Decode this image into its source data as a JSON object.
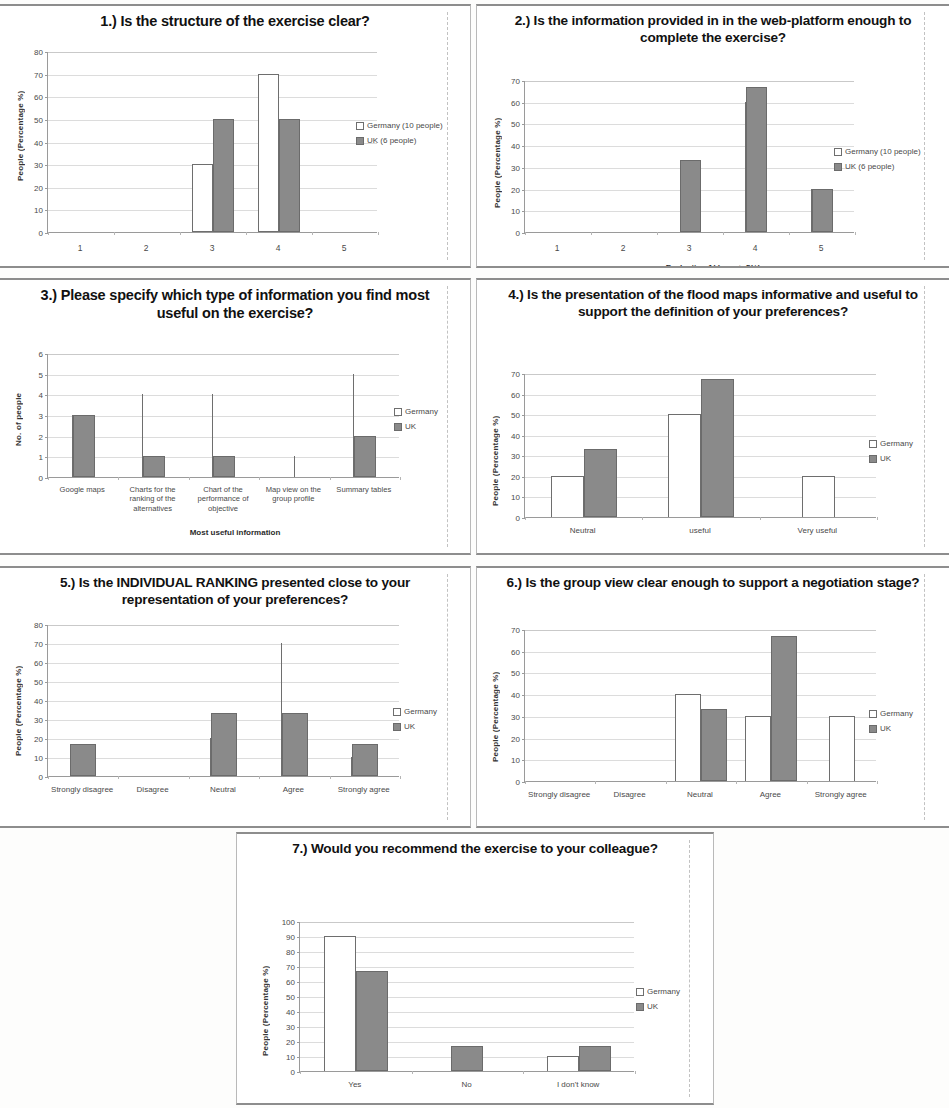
{
  "page": {
    "background": "#fdfdfc",
    "series_colors": {
      "germany": "#ffffff",
      "uk": "#8a8a8a",
      "outline": "#6e6e6e"
    }
  },
  "charts": [
    {
      "id": "q1",
      "title": "1.) Is the structure of the exercise clear?",
      "ylabel": "People (Percentage %)",
      "xlabel": "Evaluation 1(-) ------> 5(+)",
      "categories": [
        "1",
        "2",
        "3",
        "4",
        "5"
      ],
      "yticks": [
        "0",
        "10",
        "20",
        "30",
        "40",
        "50",
        "60",
        "70",
        "80"
      ],
      "legend": [
        "Germany (10 people)",
        "UK (6 people)"
      ],
      "chart_data": {
        "type": "bar",
        "title": "1.) Is the structure of the exercise clear?",
        "xlabel": "Evaluation 1(-) ------> 5(+)",
        "ylabel": "People (Percentage %)",
        "categories": [
          "1",
          "2",
          "3",
          "4",
          "5"
        ],
        "ylim": [
          0,
          80
        ],
        "ytick_step": 10,
        "grid": true,
        "legend_position": "right",
        "series": [
          {
            "name": "Germany (10 people)",
            "values": [
              0,
              0,
              30,
              70,
              0
            ]
          },
          {
            "name": "UK (6 people)",
            "values": [
              0,
              0,
              50,
              50,
              0
            ]
          }
        ]
      }
    },
    {
      "id": "q2",
      "title": "2.) Is the information provided in in the web-platform enough to complete the exercise?",
      "ylabel": "People (Percentage %)",
      "xlabel": "Evaluation 1(-) ------> 5(+)",
      "categories": [
        "1",
        "2",
        "3",
        "4",
        "5"
      ],
      "yticks": [
        "0",
        "10",
        "20",
        "30",
        "40",
        "50",
        "60",
        "70"
      ],
      "legend": [
        "Germany (10 people)",
        "UK (6 people)"
      ],
      "chart_data": {
        "type": "bar",
        "title": "2.) Is the information provided in in the web-platform enough to complete the exercise?",
        "xlabel": "Evaluation 1(-) ------> 5(+)",
        "ylabel": "People (Percentage %)",
        "categories": [
          "1",
          "2",
          "3",
          "4",
          "5"
        ],
        "ylim": [
          0,
          70
        ],
        "ytick_step": 10,
        "grid": true,
        "legend_position": "right",
        "series": [
          {
            "name": "Germany (10 people)",
            "values": [
              0,
              0,
              0,
              60,
              20
            ]
          },
          {
            "name": "UK (6 people)",
            "values": [
              0,
              0,
              33,
              67,
              20
            ]
          }
        ]
      }
    },
    {
      "id": "q3",
      "title": "3.) Please specify which type of information you find most useful on the exercise?",
      "ylabel": "No. of people",
      "xlabel": "Most useful information",
      "categories": [
        "Google maps",
        "Charts for the ranking of the alternatives",
        "Chart of the performance of objective",
        "Map view on the group profile",
        "Summary tables"
      ],
      "yticks": [
        "0",
        "1",
        "2",
        "3",
        "4",
        "5",
        "6"
      ],
      "legend": [
        "Germany",
        "UK"
      ],
      "chart_data": {
        "type": "bar",
        "title": "3.) Please specify which type of information you find most useful on the exercise?",
        "xlabel": "Most useful information",
        "ylabel": "No. of people",
        "categories": [
          "Google maps",
          "Charts for the ranking of the alternatives",
          "Chart of the performance of objective",
          "Map view on the group profile",
          "Summary tables"
        ],
        "ylim": [
          0,
          6
        ],
        "ytick_step": 1,
        "grid": true,
        "legend_position": "right",
        "series": [
          {
            "name": "Germany",
            "values": [
              3,
              4,
              4,
              1,
              5
            ]
          },
          {
            "name": "UK",
            "values": [
              3,
              1,
              1,
              0,
              2
            ]
          }
        ]
      }
    },
    {
      "id": "q4",
      "title": "4.) Is the presentation of the flood maps informative and useful to support the definition of your preferences?",
      "ylabel": "People (Percentage %)",
      "xlabel": "",
      "categories": [
        "Neutral",
        "useful",
        "Very useful"
      ],
      "yticks": [
        "0",
        "10",
        "20",
        "30",
        "40",
        "50",
        "60",
        "70"
      ],
      "legend": [
        "Germany",
        "UK"
      ],
      "chart_data": {
        "type": "bar",
        "title": "4.) Is the presentation of the flood maps informative and useful to support the definition of your preferences?",
        "xlabel": "",
        "ylabel": "People (Percentage %)",
        "categories": [
          "Neutral",
          "useful",
          "Very useful"
        ],
        "ylim": [
          0,
          70
        ],
        "ytick_step": 10,
        "grid": true,
        "legend_position": "right",
        "series": [
          {
            "name": "Germany",
            "values": [
              20,
              50,
              20
            ]
          },
          {
            "name": "UK",
            "values": [
              33,
              67,
              0
            ]
          }
        ]
      }
    },
    {
      "id": "q5",
      "title": "5.) Is the INDIVIDUAL RANKING presented close to your representation of your preferences?",
      "ylabel": "People (Percentage %)",
      "xlabel": "",
      "categories": [
        "Strongly disagree",
        "Disagree",
        "Neutral",
        "Agree",
        "Strongly agree"
      ],
      "yticks": [
        "0",
        "10",
        "20",
        "30",
        "40",
        "50",
        "60",
        "70",
        "80"
      ],
      "legend": [
        "Germany",
        "UK"
      ],
      "chart_data": {
        "type": "bar",
        "title": "5.) Is the INDIVIDUAL RANKING presented close to your representation of your preferences?",
        "xlabel": "",
        "ylabel": "People (Percentage %)",
        "categories": [
          "Strongly disagree",
          "Disagree",
          "Neutral",
          "Agree",
          "Strongly agree"
        ],
        "ylim": [
          0,
          80
        ],
        "ytick_step": 10,
        "grid": true,
        "legend_position": "right",
        "series": [
          {
            "name": "Germany",
            "values": [
              0,
              0,
              20,
              70,
              10
            ]
          },
          {
            "name": "UK",
            "values": [
              17,
              0,
              33,
              33,
              17
            ]
          }
        ]
      }
    },
    {
      "id": "q6",
      "title": "6.) Is the group view clear enough to support a negotiation stage?",
      "ylabel": "People (Percentage %)",
      "xlabel": "",
      "categories": [
        "Strongly disagree",
        "Disagree",
        "Neutral",
        "Agree",
        "Strongly agree"
      ],
      "yticks": [
        "0",
        "10",
        "20",
        "30",
        "40",
        "50",
        "60",
        "70"
      ],
      "legend": [
        "Germany",
        "UK"
      ],
      "chart_data": {
        "type": "bar",
        "title": "6.) Is the group view clear enough to support a negotiation stage?",
        "xlabel": "",
        "ylabel": "People (Percentage %)",
        "categories": [
          "Strongly disagree",
          "Disagree",
          "Neutral",
          "Agree",
          "Strongly agree"
        ],
        "ylim": [
          0,
          70
        ],
        "ytick_step": 10,
        "grid": true,
        "legend_position": "right",
        "series": [
          {
            "name": "Germany",
            "values": [
              0,
              0,
              40,
              30,
              30
            ]
          },
          {
            "name": "UK",
            "values": [
              0,
              0,
              33,
              67,
              0
            ]
          }
        ]
      }
    },
    {
      "id": "q7",
      "title": "7.) Would you recommend the exercise to your colleague?",
      "ylabel": "People (Percentage %)",
      "xlabel": "",
      "categories": [
        "Yes",
        "No",
        "I don't know"
      ],
      "yticks": [
        "0",
        "10",
        "20",
        "30",
        "40",
        "50",
        "60",
        "70",
        "80",
        "90",
        "100"
      ],
      "legend": [
        "Germany",
        "UK"
      ],
      "chart_data": {
        "type": "bar",
        "title": "7.) Would you recommend the exercise to your colleague?",
        "xlabel": "",
        "ylabel": "People (Percentage %)",
        "categories": [
          "Yes",
          "No",
          "I don't know"
        ],
        "ylim": [
          0,
          100
        ],
        "ytick_step": 10,
        "grid": true,
        "legend_position": "right",
        "series": [
          {
            "name": "Germany",
            "values": [
              90,
              0,
              10
            ]
          },
          {
            "name": "UK",
            "values": [
              67,
              17,
              17
            ]
          }
        ]
      }
    }
  ]
}
